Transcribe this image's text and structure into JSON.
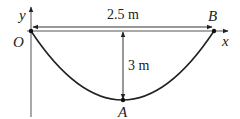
{
  "diagram": {
    "type": "parabolic-cable",
    "points": {
      "origin": {
        "label": "O",
        "x": 31,
        "y": 31
      },
      "B": {
        "label": "B",
        "x": 214,
        "y": 31
      },
      "A": {
        "label": "A",
        "x": 123,
        "y": 100
      }
    },
    "axes": {
      "x_label": "x",
      "y_label": "y"
    },
    "dimensions": {
      "span": "2.5 m",
      "sag": "3 m"
    },
    "colors": {
      "line": "#222222",
      "axis": "#444444",
      "background": "#ffffff"
    }
  }
}
